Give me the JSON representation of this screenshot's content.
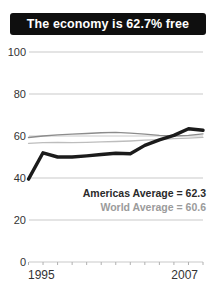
{
  "header": {
    "title": "The economy is 62.7% free"
  },
  "colors": {
    "header_bg": "#0f0f0f",
    "header_text": "#ffffff",
    "grid": "#c9c9c9",
    "axis_tick": "#b0b0b0",
    "axis_text": "#333333"
  },
  "chart_data": {
    "type": "line",
    "title": "The economy is 62.7% free",
    "x": [
      1995,
      1996,
      1997,
      1998,
      1999,
      2000,
      2001,
      2002,
      2003,
      2004,
      2005,
      2006,
      2007
    ],
    "x_labels": [
      "1995",
      "2007"
    ],
    "y_ticks": [
      "100",
      "80",
      "60",
      "40",
      "20",
      "0"
    ],
    "ylim": [
      0,
      100
    ],
    "grid": "horizontal",
    "series": [
      {
        "id": "country-score",
        "name": "Country freedom score",
        "color": "#1b1b1b",
        "width": 3.4,
        "values": [
          39.5,
          52,
          50,
          50,
          50.5,
          51.2,
          51.8,
          51.5,
          55.5,
          58.2,
          60.3,
          63.5,
          62.7
        ]
      },
      {
        "id": "americas-average",
        "name": "Americas Average",
        "color": "#8c8c8c",
        "width": 1.4,
        "values": [
          59.3,
          60.0,
          60.5,
          60.9,
          61.2,
          61.5,
          61.7,
          61.4,
          60.9,
          60.3,
          60.0,
          60.3,
          61.0
        ]
      },
      {
        "id": "world-average",
        "name": "World Average",
        "color": "#bdbdbd",
        "width": 1.3,
        "values": [
          56.5,
          56.8,
          57.0,
          56.8,
          57.0,
          57.2,
          57.4,
          57.6,
          58.0,
          58.3,
          58.7,
          59.0,
          59.4
        ]
      }
    ],
    "annotations": [
      {
        "text": "Americas Average = 62.3",
        "value": 62.3,
        "color": "#2a2a2a"
      },
      {
        "text": "World Average = 60.6",
        "value": 60.6,
        "color": "#9b9b9b"
      }
    ]
  }
}
